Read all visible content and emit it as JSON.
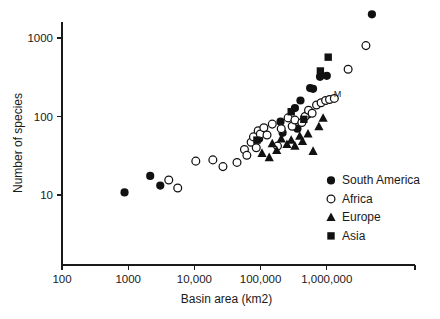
{
  "chart_data": {
    "type": "scatter",
    "title": "",
    "xlabel": "Basin area (km2)",
    "ylabel": "Number of species",
    "xscale": "log",
    "yscale": "log",
    "xlim": [
      100,
      10000000
    ],
    "ylim": [
      4,
      3000
    ],
    "grid": false,
    "xticks": [
      {
        "value": 100,
        "label": "100"
      },
      {
        "value": 1000,
        "label": "1000"
      },
      {
        "value": 10000,
        "label": "10,000"
      },
      {
        "value": 100000,
        "label": "100,000"
      },
      {
        "value": 1000000,
        "label": "1,000,000"
      }
    ],
    "yticks": [
      {
        "value": 10,
        "label": "10"
      },
      {
        "value": 100,
        "label": "100"
      },
      {
        "value": 1000,
        "label": "1000"
      }
    ],
    "legend_position": "bottom-right",
    "annotations": [
      {
        "text": "M",
        "x": 1450000,
        "y": 175
      }
    ],
    "series": [
      {
        "name": "South America",
        "marker": "filled-circle",
        "color": "#111111",
        "points": [
          [
            880,
            10.8
          ],
          [
            2150,
            17.5
          ],
          [
            3050,
            13.2
          ],
          [
            95000,
            52
          ],
          [
            200000,
            86
          ],
          [
            215000,
            62
          ],
          [
            330000,
            128
          ],
          [
            360000,
            70
          ],
          [
            400000,
            160
          ],
          [
            510000,
            105
          ],
          [
            560000,
            230
          ],
          [
            620000,
            225
          ],
          [
            790000,
            320
          ],
          [
            1000000,
            330
          ],
          [
            4800000,
            2000
          ]
        ]
      },
      {
        "name": "Africa",
        "marker": "open-circle",
        "color": "#111111",
        "points": [
          [
            4100,
            15.5
          ],
          [
            5600,
            12.3
          ],
          [
            10500,
            27
          ],
          [
            19000,
            28
          ],
          [
            27000,
            23
          ],
          [
            44000,
            26
          ],
          [
            57000,
            38
          ],
          [
            62000,
            32
          ],
          [
            72000,
            47
          ],
          [
            78000,
            55
          ],
          [
            86000,
            40
          ],
          [
            92000,
            66
          ],
          [
            99000,
            60
          ],
          [
            112000,
            72
          ],
          [
            125000,
            58
          ],
          [
            150000,
            80
          ],
          [
            180000,
            42
          ],
          [
            205000,
            70
          ],
          [
            260000,
            96
          ],
          [
            300000,
            75
          ],
          [
            330000,
            90
          ],
          [
            420000,
            84
          ],
          [
            470000,
            100
          ],
          [
            530000,
            120
          ],
          [
            600000,
            110
          ],
          [
            700000,
            140
          ],
          [
            820000,
            150
          ],
          [
            960000,
            160
          ],
          [
            1100000,
            165
          ],
          [
            1300000,
            170
          ],
          [
            2100000,
            400
          ],
          [
            3900000,
            800
          ]
        ]
      },
      {
        "name": "Europe",
        "marker": "filled-triangle",
        "color": "#111111",
        "points": [
          [
            105000,
            34
          ],
          [
            135000,
            30
          ],
          [
            150000,
            45
          ],
          [
            175000,
            37
          ],
          [
            205000,
            52
          ],
          [
            250000,
            44
          ],
          [
            290000,
            50
          ],
          [
            330000,
            42
          ],
          [
            390000,
            56
          ],
          [
            430000,
            48
          ],
          [
            520000,
            60
          ],
          [
            620000,
            36
          ],
          [
            760000,
            74
          ],
          [
            880000,
            95
          ]
        ]
      },
      {
        "name": "Asia",
        "marker": "filled-square",
        "color": "#111111",
        "points": [
          [
            88000,
            50
          ],
          [
            290000,
            115
          ],
          [
            450000,
            92
          ],
          [
            800000,
            380
          ],
          [
            1050000,
            570
          ]
        ]
      }
    ]
  },
  "legend": {
    "items": [
      {
        "label": "South America",
        "marker": "filled-circle"
      },
      {
        "label": "Africa",
        "marker": "open-circle"
      },
      {
        "label": "Europe",
        "marker": "filled-triangle"
      },
      {
        "label": "Asia",
        "marker": "filled-square"
      }
    ]
  }
}
